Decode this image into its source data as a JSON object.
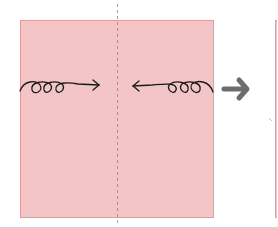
{
  "diagram": {
    "type": "origami-step",
    "paper_color": "#f4c5c6",
    "paper_border": "#e59a9d",
    "fold_line": {
      "style": "valley-dashed",
      "color": "#a07f88"
    },
    "arrows": [
      {
        "name": "fold-left-edge-to-center",
        "direction": "right"
      },
      {
        "name": "fold-right-edge-to-center",
        "direction": "left"
      }
    ],
    "step_arrow": {
      "color": "#6d6d6d",
      "direction": "right"
    },
    "next_panel": {
      "partially_visible": true
    }
  }
}
